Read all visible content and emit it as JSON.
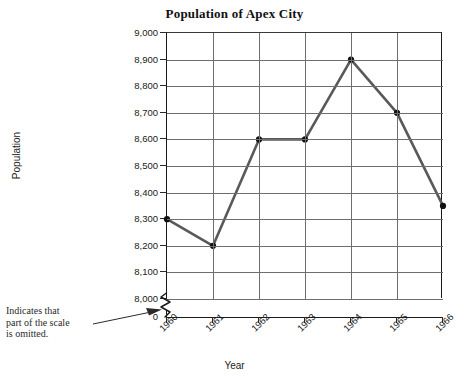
{
  "chart_data": {
    "type": "line",
    "title": "Population of Apex City",
    "xlabel": "Year",
    "ylabel": "Population",
    "categories": [
      "1960",
      "1961",
      "1962",
      "1963",
      "1964",
      "1965",
      "1966"
    ],
    "values": [
      8300,
      8200,
      8600,
      8600,
      8900,
      8700,
      8350
    ],
    "series": [
      {
        "name": "Population",
        "values": [
          8300,
          8200,
          8600,
          8600,
          8900,
          8700,
          8350
        ]
      }
    ],
    "ylim": [
      8000,
      9000
    ],
    "ytick_labels": [
      "9,000",
      "8,900",
      "8,800",
      "8,700",
      "8,600",
      "8,500",
      "8,400",
      "8,300",
      "8,200",
      "8,100",
      "8,000",
      "0"
    ],
    "ytick_values": [
      9000,
      8900,
      8800,
      8700,
      8600,
      8500,
      8400,
      8300,
      8200,
      8100,
      8000,
      0
    ],
    "grid": true,
    "legend": "none",
    "axis_break": {
      "present": true,
      "between": [
        "8,000",
        "0"
      ],
      "note": "Indicates that part of the scale is omitted."
    },
    "line_color": "#595959",
    "marker_color": "#111111",
    "grid_color": "#6e6e6e",
    "axis_color": "#1a1a1a"
  },
  "annotation": {
    "line1": "Indicates that",
    "line2": "part of the scale",
    "line3": "is omitted.",
    "full_text": "Indicates that part of the scale is omitted."
  }
}
